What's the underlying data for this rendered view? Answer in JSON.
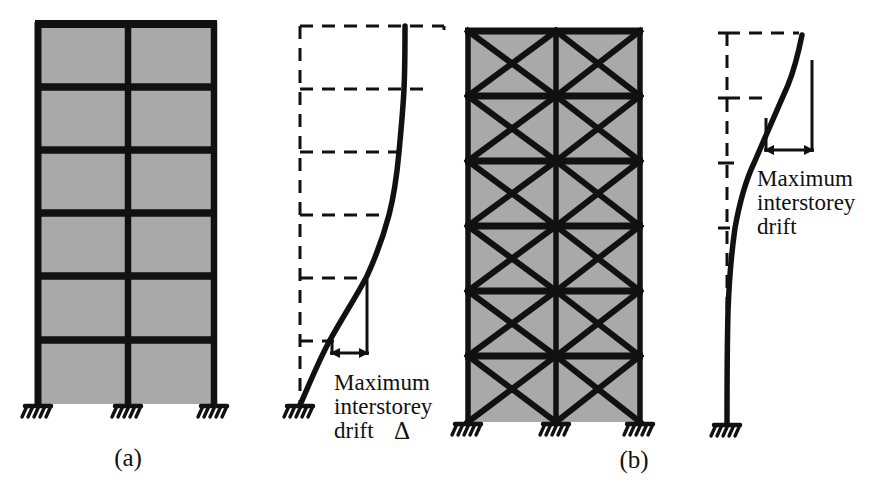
{
  "figure": {
    "width": 884,
    "height": 485,
    "background": "#ffffff"
  },
  "colors": {
    "ink": "#111111",
    "panel_fill": "#a9a9a9",
    "panel_fill_light": "#b0b0b0",
    "paper": "#ffffff"
  },
  "panels": [
    {
      "key": "moment_frame",
      "caption": "(a)",
      "caption_x": 128,
      "caption_y": 466,
      "type": "moment-resisting-frame",
      "storeys": 6,
      "bays": 2,
      "geometry": {
        "x_left": 38,
        "x_mid": 128,
        "x_right": 214,
        "y_top": 24,
        "y_base": 404,
        "floor_lines": [
          24,
          87,
          150,
          213,
          276,
          340,
          404
        ]
      },
      "supports": [
        {
          "x": 38,
          "y": 404,
          "kind": "fixed"
        },
        {
          "x": 128,
          "y": 404,
          "kind": "fixed"
        },
        {
          "x": 214,
          "y": 404,
          "kind": "fixed"
        }
      ]
    },
    {
      "key": "braced_frame",
      "caption": "(b)",
      "caption_x": 634,
      "caption_y": 468,
      "type": "x-braced-frame",
      "storeys": 6,
      "bays": 2,
      "geometry": {
        "x_left": 468,
        "x_mid": 556,
        "x_right": 640,
        "y_top": 31,
        "y_base": 422,
        "floor_lines": [
          31,
          96,
          161,
          226,
          291,
          356,
          422
        ]
      },
      "supports": [
        {
          "x": 468,
          "y": 422,
          "kind": "fixed"
        },
        {
          "x": 556,
          "y": 422,
          "kind": "fixed"
        },
        {
          "x": 640,
          "y": 422,
          "kind": "fixed"
        }
      ]
    }
  ],
  "deflections": [
    {
      "key": "moment_frame_deflection",
      "mode": "shear",
      "description": "Shear-type deflected shape of moment frame, largest interstorey drift near base",
      "base": {
        "x": 300,
        "y": 405
      },
      "undeformed": {
        "x": 300,
        "y_top": 26,
        "y_base": 405,
        "floor_lines": [
          26,
          89,
          152,
          215,
          278,
          341
        ],
        "right_offsets": [
          144,
          126,
          108,
          88,
          62,
          34
        ]
      },
      "curve_points": [
        {
          "x": 300,
          "y": 405
        },
        {
          "x": 312,
          "y": 372
        },
        {
          "x": 329,
          "y": 341
        },
        {
          "x": 350,
          "y": 278
        },
        {
          "x": 367,
          "y": 215
        },
        {
          "x": 380,
          "y": 152
        },
        {
          "x": 390,
          "y": 89
        },
        {
          "x": 396,
          "y": 26
        }
      ],
      "drift_marker": {
        "y_top": 288,
        "y_bottom": 352,
        "x_upper": 358,
        "x_lower": 330,
        "arrow_y": 352
      },
      "label": {
        "lines": [
          "Maximum",
          "interstorey",
          "drift"
        ],
        "symbol": "Δ",
        "x": 334,
        "y": 388,
        "line_height": 26
      }
    },
    {
      "key": "braced_frame_deflection",
      "mode": "flexural",
      "description": "Cantilever (flexural) deflected shape of braced frame, largest interstorey drift at top",
      "base": {
        "x": 727,
        "y": 424
      },
      "undeformed": {
        "x": 727,
        "y_top": 33,
        "y_base": 424,
        "floor_lines": [
          33,
          98,
          163,
          228
        ],
        "right_offsets": [
          72,
          42,
          16,
          6
        ]
      },
      "curve_points": [
        {
          "x": 727,
          "y": 424
        },
        {
          "x": 727,
          "y": 330
        },
        {
          "x": 730,
          "y": 260
        },
        {
          "x": 738,
          "y": 200
        },
        {
          "x": 752,
          "y": 140
        },
        {
          "x": 772,
          "y": 85
        },
        {
          "x": 790,
          "y": 50
        },
        {
          "x": 803,
          "y": 35
        }
      ],
      "drift_marker": {
        "y_top": 115,
        "y_bottom": 165,
        "x_upper": 812,
        "x_lower": 770,
        "arrow_y": 165
      },
      "label": {
        "lines": [
          "Maximum",
          "interstorey",
          "drift"
        ],
        "symbol": "",
        "x": 762,
        "y": 186,
        "line_height": 26
      }
    }
  ],
  "annotations": {
    "maximum": "Maximum",
    "interstorey": "interstorey",
    "drift": "drift",
    "delta": "Δ",
    "caption_a": "(a)",
    "caption_b": "(b)"
  }
}
